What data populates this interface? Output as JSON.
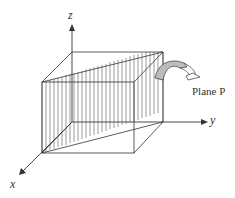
{
  "diagram": {
    "axes": {
      "x_label": "x",
      "y_label": "y",
      "z_label": "z"
    },
    "plane_label": "Plane P",
    "colors": {
      "line": "#333333",
      "hatch": "#555555",
      "arrow_fill": "#bbbbbb"
    }
  }
}
